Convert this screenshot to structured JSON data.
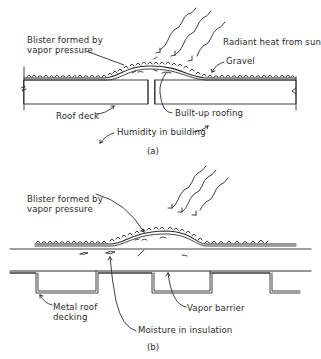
{
  "figure_a": {
    "caption": "(a)",
    "labels": {
      "blister_line1": "Blister formed by",
      "blister_line2": "vapor pressure",
      "radiant_heat": "Radiant heat from sun",
      "gravel": "Gravel",
      "roof_deck": "Roof deck",
      "built_up_roofing": "Built-up roofing",
      "humidity": "Humidity in building"
    }
  },
  "figure_b": {
    "caption": "(b)",
    "labels": {
      "blister_line1": "Blister formed by",
      "blister_line2": "vapor pressure",
      "metal_deck_line1": "Metal roof",
      "metal_deck_line2": "decking",
      "vapor_barrier": "Vapor barrier",
      "moisture": "Moisture in insulation"
    }
  },
  "colors": {
    "ink": "#2a2a2a",
    "background": "#ffffff"
  }
}
